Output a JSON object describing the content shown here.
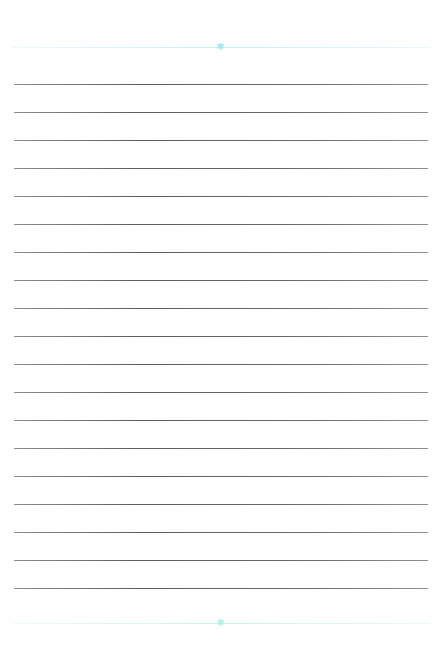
{
  "document": {
    "type": "lined-paper",
    "colors": {
      "rule": "#666666",
      "decoration_top": "#bdeef6",
      "decoration_bottom": "#c3f2e8"
    },
    "decorations": {
      "top_star_icon": "✱",
      "bottom_star_icon": "✱"
    },
    "rules": {
      "count": 19,
      "first_y": 84,
      "spacing": 28
    }
  }
}
